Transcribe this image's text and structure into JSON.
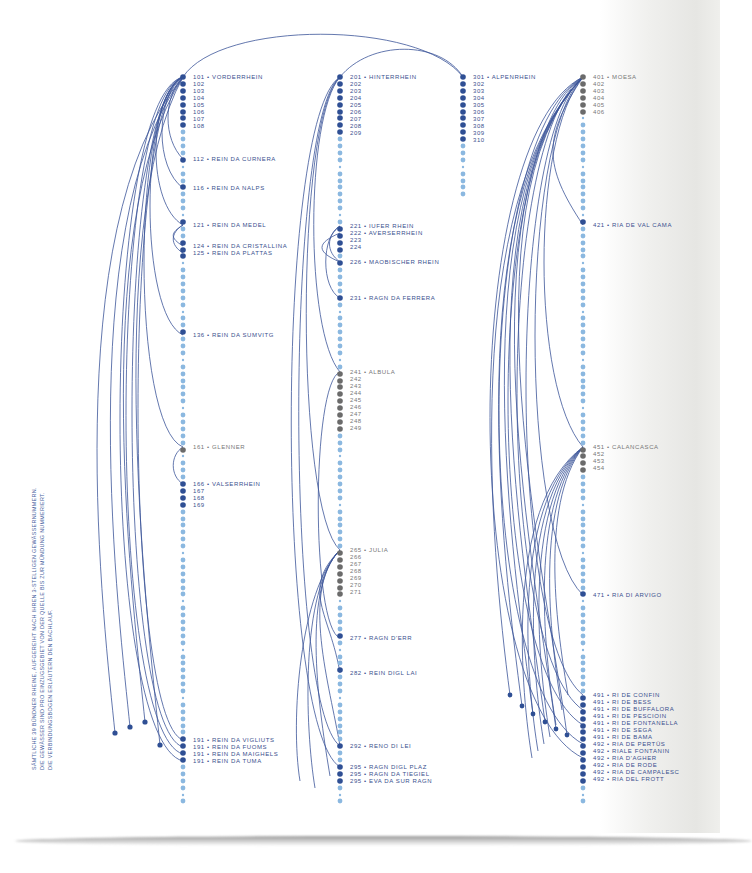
{
  "caption": {
    "line1": "SÄMTLICHE 39 BÜNDNER RHEINE, AUFGEREIHT NACH IHREN 3-STELLIGEN GEWÄSSERNUMMERN.",
    "line2": "DIE GEWÄSSER SIND PRO EINZUGSGEBIET VON DER QUELLE BIS ZUR MÜNDUNG NUMMERIERT.",
    "line3": "DIE VERBINDUNGSBOGEN ERLÄUTERN DEN BACHLAUF."
  },
  "colors": {
    "dark_dot": "#2f4f94",
    "light_dot": "#8bb8e0",
    "grey_dot": "#6b6b6b",
    "arc": "#3c5599",
    "label": "#3a4f8e"
  },
  "columns": [
    {
      "id": "100",
      "labels": [
        {
          "text": "101 • VORDERRHEIN",
          "y": 77
        },
        {
          "text": "102",
          "y": 84
        },
        {
          "text": "103",
          "y": 91
        },
        {
          "text": "104",
          "y": 98
        },
        {
          "text": "105",
          "y": 105
        },
        {
          "text": "106",
          "y": 112
        },
        {
          "text": "107",
          "y": 119
        },
        {
          "text": "108",
          "y": 126
        },
        {
          "text": "112 • REIN DA CURNERA",
          "y": 159
        },
        {
          "text": "116 • REIN DA NALPS",
          "y": 188
        },
        {
          "text": "121 • REIN DA MEDEL",
          "y": 225
        },
        {
          "text": "124 • REIN DA CRISTALLINA",
          "y": 246
        },
        {
          "text": "125 • REIN DA PLATTAS",
          "y": 253
        },
        {
          "text": "136 • REIN DA SUMVITG",
          "y": 335
        },
        {
          "text": "161 • GLENNER",
          "y": 447
        },
        {
          "text": "166 • VALSERRHEIN",
          "y": 484
        },
        {
          "text": "167",
          "y": 491
        },
        {
          "text": "168",
          "y": 498
        },
        {
          "text": "169",
          "y": 505
        },
        {
          "text": "191 • REIN DA VIGLIUTS",
          "y": 740
        },
        {
          "text": "191 • REIN DA FUOMS",
          "y": 747
        },
        {
          "text": "191 • REIN DA MAIGHELS",
          "y": 754
        },
        {
          "text": "191 • REIN DA TUMA",
          "y": 761
        }
      ]
    },
    {
      "id": "200",
      "labels": [
        {
          "text": "201 • HINTERRHEIN",
          "y": 77
        },
        {
          "text": "202",
          "y": 84
        },
        {
          "text": "203",
          "y": 91
        },
        {
          "text": "204",
          "y": 98
        },
        {
          "text": "205",
          "y": 105
        },
        {
          "text": "206",
          "y": 112
        },
        {
          "text": "207",
          "y": 119
        },
        {
          "text": "208",
          "y": 126
        },
        {
          "text": "209",
          "y": 133
        },
        {
          "text": "221 • IUFER RHEIN",
          "y": 226
        },
        {
          "text": "222 • AVERSERRHEIN",
          "y": 233
        },
        {
          "text": "223",
          "y": 240
        },
        {
          "text": "224",
          "y": 247
        },
        {
          "text": "226 • MAOBISCHER RHEIN",
          "y": 262
        },
        {
          "text": "231 • RAGN DA FERRERA",
          "y": 298
        },
        {
          "text": "241 • ALBULA",
          "y": 372
        },
        {
          "text": "242",
          "y": 379
        },
        {
          "text": "243",
          "y": 386
        },
        {
          "text": "244",
          "y": 393
        },
        {
          "text": "245",
          "y": 400
        },
        {
          "text": "246",
          "y": 407
        },
        {
          "text": "247",
          "y": 414
        },
        {
          "text": "248",
          "y": 421
        },
        {
          "text": "249",
          "y": 428
        },
        {
          "text": "265 • JULIA",
          "y": 550
        },
        {
          "text": "266",
          "y": 557
        },
        {
          "text": "267",
          "y": 564
        },
        {
          "text": "268",
          "y": 571
        },
        {
          "text": "269",
          "y": 578
        },
        {
          "text": "270",
          "y": 585
        },
        {
          "text": "271",
          "y": 592
        },
        {
          "text": "277 • RAGN D'ERR",
          "y": 638
        },
        {
          "text": "282 • REIN DIGL LAI",
          "y": 673
        },
        {
          "text": "292 • RENO DI LEI",
          "y": 746
        },
        {
          "text": "295 • RAGN DIGL PLAZ",
          "y": 767
        },
        {
          "text": "295 • RAGN DA TIEGIEL",
          "y": 774
        },
        {
          "text": "295 • EVA DA SUR RAGN",
          "y": 781
        }
      ]
    },
    {
      "id": "300",
      "labels": [
        {
          "text": "301 • ALPENRHEIN",
          "y": 77
        },
        {
          "text": "302",
          "y": 84
        },
        {
          "text": "303",
          "y": 91
        },
        {
          "text": "304",
          "y": 98
        },
        {
          "text": "305",
          "y": 105
        },
        {
          "text": "306",
          "y": 112
        },
        {
          "text": "307",
          "y": 119
        },
        {
          "text": "308",
          "y": 126
        },
        {
          "text": "309",
          "y": 133
        },
        {
          "text": "310",
          "y": 140
        }
      ]
    },
    {
      "id": "400",
      "labels": [
        {
          "text": "401 • MOESA",
          "y": 77
        },
        {
          "text": "402",
          "y": 84
        },
        {
          "text": "403",
          "y": 91
        },
        {
          "text": "404",
          "y": 98
        },
        {
          "text": "405",
          "y": 105
        },
        {
          "text": "406",
          "y": 112
        },
        {
          "text": "421 • RIA DE VAL CAMA",
          "y": 225
        },
        {
          "text": "451 • CALANCASCA",
          "y": 447
        },
        {
          "text": "452",
          "y": 454
        },
        {
          "text": "453",
          "y": 461
        },
        {
          "text": "454",
          "y": 468
        },
        {
          "text": "471 • RIA DI ARVIGO",
          "y": 595
        },
        {
          "text": "491 • RI DE CONFIN",
          "y": 695
        },
        {
          "text": "491 • RI DE BESS",
          "y": 702
        },
        {
          "text": "491 • RI DE BUFFALORA",
          "y": 709
        },
        {
          "text": "491 • RI DE PESCIOIN",
          "y": 716
        },
        {
          "text": "491 • RI DE FONTANELLA",
          "y": 723
        },
        {
          "text": "491 • RI DE SEGA",
          "y": 730
        },
        {
          "text": "491 • RI DE BAMA",
          "y": 737
        },
        {
          "text": "492 • RIA DE PERTÜS",
          "y": 744
        },
        {
          "text": "492 • RIALE FONTANIN",
          "y": 751
        },
        {
          "text": "492 • RIA D'AGHER",
          "y": 758
        },
        {
          "text": "492 • RIA DE RODE",
          "y": 765
        },
        {
          "text": "492 • RIA DE CAMPALESC",
          "y": 772
        },
        {
          "text": "492 • RIA DEL FROTT",
          "y": 779
        }
      ]
    }
  ]
}
